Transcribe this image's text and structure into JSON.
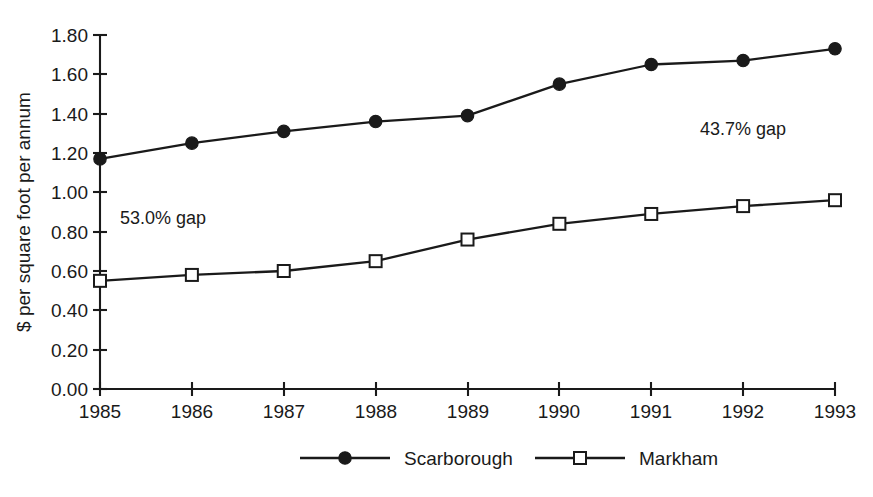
{
  "chart_data": {
    "type": "line",
    "title": "",
    "subtitle": "",
    "xlabel": "",
    "ylabel": "$ per square foot per annum",
    "categories": [
      "1985",
      "1986",
      "1987",
      "1988",
      "1989",
      "1990",
      "1991",
      "1992",
      "1993"
    ],
    "x": [
      1985,
      1986,
      1987,
      1988,
      1989,
      1990,
      1991,
      1992,
      1993
    ],
    "series": [
      {
        "name": "Scarborough",
        "marker": "filled-circle",
        "values": [
          1.17,
          1.25,
          1.31,
          1.36,
          1.39,
          1.55,
          1.65,
          1.67,
          1.73
        ]
      },
      {
        "name": "Markham",
        "marker": "open-square",
        "values": [
          0.55,
          0.58,
          0.6,
          0.65,
          0.76,
          0.84,
          0.89,
          0.93,
          0.96
        ]
      }
    ],
    "ylim": [
      0.0,
      1.8
    ],
    "ytick_labels": [
      "0.00",
      "0.20",
      "0.40",
      "0.60",
      "0.80",
      "1.00",
      "1.20",
      "1.40",
      "1.60",
      "1.80"
    ],
    "ytick_values": [
      0.0,
      0.2,
      0.4,
      0.6,
      0.8,
      1.0,
      1.2,
      1.4,
      1.6,
      1.8
    ],
    "grid": false,
    "legend_position": "bottom",
    "annotations": [
      {
        "text": "53.0% gap",
        "x": 1985.5,
        "y": 0.86
      },
      {
        "text": "43.7% gap",
        "x": 1991.6,
        "y": 1.3
      }
    ],
    "colors": {
      "ink": "#1a1a1a",
      "background": "#ffffff",
      "scarborough": "#1a1a1a",
      "markham": "#1a1a1a"
    }
  },
  "axis": {
    "y_title": "$ per square foot per annum",
    "y_ticks": [
      "1.80",
      "1.60",
      "1.40",
      "1.20",
      "1.00",
      "0.80",
      "0.60",
      "0.40",
      "0.20",
      "0.00"
    ],
    "x_ticks": [
      "1985",
      "1986",
      "1987",
      "1988",
      "1989",
      "1990",
      "1991",
      "1992",
      "1993"
    ]
  },
  "annotations": {
    "left_gap": "53.0% gap",
    "right_gap": "43.7% gap"
  },
  "legend": {
    "entries": [
      {
        "label": "Scarborough",
        "marker": "filled-circle-marker"
      },
      {
        "label": "Markham",
        "marker": "open-square-marker"
      }
    ]
  }
}
